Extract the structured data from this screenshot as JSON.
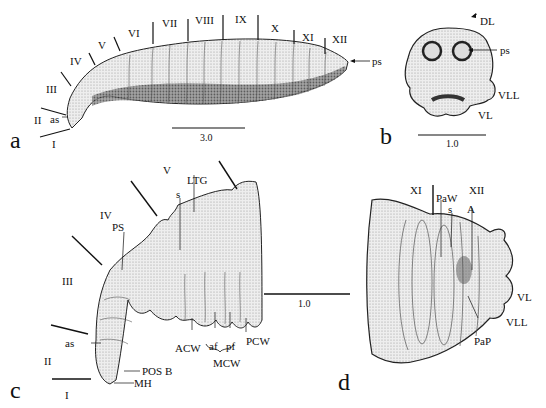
{
  "figure": {
    "panels": [
      {
        "id": "a",
        "letter": "a",
        "view": "whole larva, lateral",
        "segment_labels": [
          "I",
          "II",
          "III",
          "IV",
          "V",
          "VI",
          "VII",
          "VIII",
          "IX",
          "X",
          "XI",
          "XII"
        ],
        "structure_labels": [
          "as",
          "ps"
        ],
        "scale_bar": "3.0"
      },
      {
        "id": "b",
        "letter": "b",
        "view": "posterior end",
        "structure_labels": [
          "DL",
          "ps",
          "VLL",
          "VL"
        ],
        "scale_bar": "1.0"
      },
      {
        "id": "c",
        "letter": "c",
        "view": "anterior segments, lateral",
        "segment_labels": [
          "I",
          "II",
          "III",
          "IV",
          "V"
        ],
        "structure_labels": [
          "as",
          "PS",
          "s",
          "LTG",
          "POS B",
          "MH",
          "ACW",
          "af",
          "pf",
          "MCW",
          "PCW"
        ],
        "scale_bar": "1.0"
      },
      {
        "id": "d",
        "letter": "d",
        "view": "posterior segments, lateral",
        "segment_labels": [
          "XI",
          "XII"
        ],
        "structure_labels": [
          "PaW",
          "s",
          "A",
          "VL",
          "VLL",
          "PaP"
        ]
      }
    ]
  },
  "labels": {
    "a": {
      "I": "I",
      "II": "II",
      "III": "III",
      "IV": "IV",
      "V": "V",
      "VI": "VI",
      "VII": "VII",
      "VIII": "VIII",
      "IX": "IX",
      "X": "X",
      "XI": "XI",
      "XII": "XII",
      "as": "as",
      "ps": "ps",
      "scale": "3.0",
      "letter": "a"
    },
    "b": {
      "DL": "DL",
      "ps": "ps",
      "VLL": "VLL",
      "VL": "VL",
      "scale": "1.0",
      "letter": "b"
    },
    "c": {
      "I": "I",
      "II": "II",
      "III": "III",
      "IV": "IV",
      "V": "V",
      "as": "as",
      "PS": "PS",
      "s": "s",
      "LTG": "LTG",
      "POSB": "POS B",
      "MH": "MH",
      "ACW": "ACW",
      "af": "af",
      "pf": "pf",
      "MCW": "MCW",
      "PCW": "PCW",
      "scale": "1.0",
      "letter": "c"
    },
    "d": {
      "XI": "XI",
      "XII": "XII",
      "PaW": "PaW",
      "s": "s",
      "A": "A",
      "VL": "VL",
      "VLL": "VLL",
      "PaP": "PaP",
      "letter": "d"
    }
  }
}
